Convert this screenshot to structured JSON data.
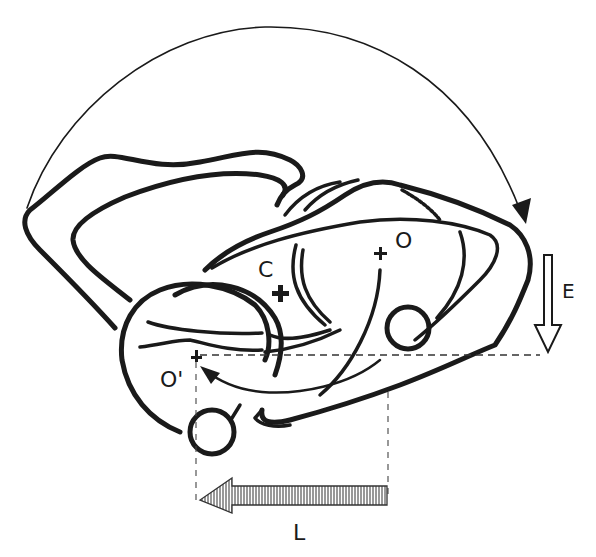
{
  "diagram": {
    "type": "mechanical rotation schematic (line drawing)",
    "colors": {
      "ink": "#1a1a1a",
      "background": "#ffffff",
      "dashed": "#444444"
    },
    "labels": {
      "center_of_mass": "C",
      "original_pivot": "O",
      "new_pivot": "O'",
      "vertical_displacement": "E",
      "horizontal_displacement": "L"
    },
    "arrows": [
      {
        "id": "rotation-arc",
        "description": "large arc arrow from left over top to right, arrowhead pointing down at right"
      },
      {
        "id": "E",
        "description": "hollow arrow pointing down, vertical displacement"
      },
      {
        "id": "L",
        "description": "hatched arrow pointing left, horizontal displacement"
      },
      {
        "id": "pivot-path",
        "description": "curved arrow from O region to O'"
      }
    ],
    "markers": [
      {
        "label": "C",
        "glyph": "bold plus"
      },
      {
        "label": "O",
        "glyph": "plus"
      },
      {
        "label": "O'",
        "glyph": "plus"
      }
    ]
  }
}
